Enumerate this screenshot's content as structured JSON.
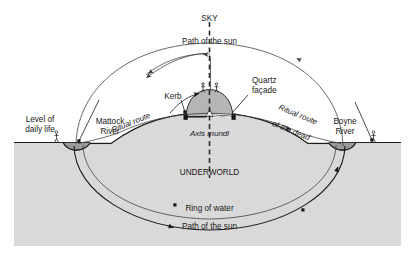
{
  "figure": {
    "width": 419,
    "height": 263
  },
  "colors": {
    "ground": "#d9d9d9",
    "mound": "#b5b5b5",
    "river": "#9a9a9a",
    "line": "#1a1a1a",
    "background": "#ffffff"
  },
  "labels": {
    "sky": "SKY",
    "path_of_sun_top": "Path of the sun",
    "kerb": "Kerb",
    "quartz_facade_line1": "Quartz",
    "quartz_facade_line2": "façade",
    "level_of_daily_life_line1": "Level of",
    "level_of_daily_life_line2": "daily life",
    "mattock_river_line1": "Mattock",
    "mattock_river_line2": "River",
    "boyne_river_line1": "Boyne",
    "boyne_river_line2": "River",
    "ritual_route": "Ritual route",
    "ritual_route_dead_line1": "Ritual route",
    "ritual_route_dead_line2": "of the dead",
    "axis_mundi": "Axis mundi",
    "underworld": "UNDERWORLD",
    "ring_of_water": "Ring of water",
    "path_of_sun_bottom": "Path of the sun"
  },
  "icons": {
    "human_figure_left": "person-icon",
    "human_figure_right": "person-icon",
    "human_figure_mound_left": "person-icon",
    "human_figure_mound_right": "person-icon",
    "axis_mundi_line": "vertical-dashed-axis-icon"
  }
}
